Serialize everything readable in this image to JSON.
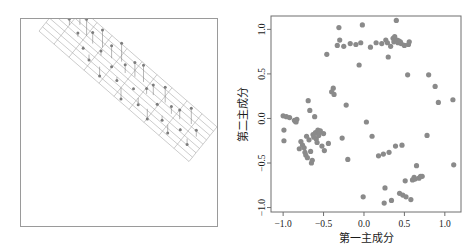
{
  "figure": {
    "panels": [
      {
        "name": "3d-regression-plane-plot",
        "type": "scatter3d-with-plane",
        "description": "3D scatter of observations with fitted regression plane and vertical residual drop-lines"
      },
      {
        "name": "pca-scatter-plot",
        "type": "scatter"
      }
    ]
  },
  "chart_data": [
    {
      "type": "scatter",
      "name": "3d-plane-panel",
      "title": "",
      "xlabel": "",
      "ylabel": "",
      "grid": false,
      "legend": false,
      "surface": {
        "kind": "regression-plane",
        "u_lines": 11,
        "v_lines": 9,
        "color": "#8c8c8c"
      },
      "note": "Points connected to the plane by vertical segments (residuals)",
      "points3d": [
        [
          0.06,
          0.62,
          0.3
        ],
        [
          0.1,
          0.55,
          0.13
        ],
        [
          0.14,
          0.71,
          0.42
        ],
        [
          0.17,
          0.48,
          0.08
        ],
        [
          0.2,
          0.63,
          0.35
        ],
        [
          0.22,
          0.4,
          -0.05
        ],
        [
          0.25,
          0.58,
          0.24
        ],
        [
          0.27,
          0.34,
          -0.12
        ],
        [
          0.3,
          0.66,
          0.38
        ],
        [
          0.32,
          0.5,
          0.1
        ],
        [
          0.35,
          0.29,
          -0.2
        ],
        [
          0.37,
          0.61,
          0.27
        ],
        [
          0.4,
          0.45,
          0.02
        ],
        [
          0.42,
          0.7,
          0.4
        ],
        [
          0.45,
          0.37,
          -0.08
        ],
        [
          0.47,
          0.56,
          0.18
        ],
        [
          0.5,
          0.25,
          -0.25
        ],
        [
          0.52,
          0.64,
          0.31
        ],
        [
          0.55,
          0.43,
          -0.02
        ],
        [
          0.57,
          0.68,
          0.36
        ],
        [
          0.6,
          0.33,
          -0.15
        ],
        [
          0.62,
          0.52,
          0.12
        ],
        [
          0.65,
          0.6,
          0.22
        ],
        [
          0.67,
          0.28,
          -0.22
        ],
        [
          0.7,
          0.47,
          0.04
        ],
        [
          0.72,
          0.65,
          0.33
        ],
        [
          0.75,
          0.38,
          -0.1
        ],
        [
          0.78,
          0.55,
          0.16
        ],
        [
          0.8,
          0.31,
          -0.18
        ],
        [
          0.83,
          0.58,
          0.2
        ],
        [
          0.86,
          0.44,
          -0.04
        ],
        [
          0.89,
          0.67,
          0.34
        ],
        [
          0.92,
          0.36,
          -0.13
        ],
        [
          0.95,
          0.53,
          0.14
        ]
      ]
    },
    {
      "type": "scatter",
      "name": "pca-scatter",
      "title": "",
      "xlabel": "第一主成分",
      "ylabel": "第二主成分",
      "xlim": [
        -1.15,
        1.2
      ],
      "ylim": [
        -1.05,
        1.15
      ],
      "xticks": [
        -1.0,
        -0.5,
        0.0,
        0.5,
        1.0
      ],
      "xticklabels": [
        "-1.0",
        "-0.5",
        "0.0",
        "0.5",
        "1.0"
      ],
      "yticks": [
        -1.0,
        -0.5,
        0.0,
        0.5,
        1.0
      ],
      "yticklabels": [
        "-1.0",
        "-0.5",
        "0.0",
        "0.5",
        "1.0"
      ],
      "grid": false,
      "legend": false,
      "marker": {
        "shape": "circle",
        "color": "#8a8a8a",
        "size": 2.6
      },
      "points": [
        [
          -1.0,
          0.03
        ],
        [
          -0.99,
          -0.13
        ],
        [
          -0.99,
          -0.25
        ],
        [
          -0.96,
          0.02
        ],
        [
          -0.92,
          0.01
        ],
        [
          -0.86,
          -0.02
        ],
        [
          -0.85,
          -0.03
        ],
        [
          -0.84,
          -0.04
        ],
        [
          -0.83,
          -0.01
        ],
        [
          -0.8,
          -0.34
        ],
        [
          -0.78,
          -0.26
        ],
        [
          -0.76,
          -0.3
        ],
        [
          -0.74,
          -0.33
        ],
        [
          -0.73,
          -0.38
        ],
        [
          -0.72,
          -0.41
        ],
        [
          -0.71,
          -0.2
        ],
        [
          -0.7,
          -0.44
        ],
        [
          -0.69,
          0.2
        ],
        [
          -0.68,
          -0.24
        ],
        [
          -0.67,
          0.09
        ],
        [
          -0.66,
          -0.37
        ],
        [
          -0.65,
          -0.5
        ],
        [
          -0.64,
          -0.47
        ],
        [
          -0.63,
          -0.18
        ],
        [
          -0.62,
          -0.21
        ],
        [
          -0.61,
          0.02
        ],
        [
          -0.6,
          -0.16
        ],
        [
          -0.59,
          -0.23
        ],
        [
          -0.58,
          -0.27
        ],
        [
          -0.57,
          -0.13
        ],
        [
          -0.56,
          -0.19
        ],
        [
          -0.55,
          -0.15
        ],
        [
          -0.54,
          -0.14
        ],
        [
          -0.52,
          -0.31
        ],
        [
          -0.5,
          -0.17
        ],
        [
          -0.49,
          -0.36
        ],
        [
          -0.46,
          0.72
        ],
        [
          -0.44,
          -0.28
        ],
        [
          -0.4,
          0.3
        ],
        [
          -0.38,
          0.34
        ],
        [
          -0.37,
          0.27
        ],
        [
          -0.33,
          0.82
        ],
        [
          -0.31,
          1.02
        ],
        [
          -0.3,
          0.88
        ],
        [
          -0.27,
          -0.22
        ],
        [
          -0.25,
          0.81
        ],
        [
          -0.22,
          0.15
        ],
        [
          -0.2,
          -0.46
        ],
        [
          -0.17,
          0.84
        ],
        [
          -0.1,
          0.83
        ],
        [
          -0.06,
          0.6
        ],
        [
          -0.04,
          0.85
        ],
        [
          -0.02,
          1.05
        ],
        [
          -0.01,
          -0.88
        ],
        [
          0.03,
          -0.04
        ],
        [
          0.08,
          0.8
        ],
        [
          0.1,
          -0.2
        ],
        [
          0.15,
          0.85
        ],
        [
          0.18,
          -0.42
        ],
        [
          0.22,
          0.84
        ],
        [
          0.24,
          -0.4
        ],
        [
          0.25,
          -0.95
        ],
        [
          0.26,
          -0.78
        ],
        [
          0.27,
          0.88
        ],
        [
          0.29,
          0.85
        ],
        [
          0.3,
          0.69
        ],
        [
          0.31,
          -0.38
        ],
        [
          0.33,
          0.81
        ],
        [
          0.34,
          -0.92
        ],
        [
          0.36,
          0.9
        ],
        [
          0.37,
          0.86
        ],
        [
          0.38,
          0.92
        ],
        [
          0.39,
          -0.31
        ],
        [
          0.4,
          1.1
        ],
        [
          0.41,
          0.88
        ],
        [
          0.42,
          0.85
        ],
        [
          0.43,
          0.87
        ],
        [
          0.44,
          -0.84
        ],
        [
          0.45,
          0.86
        ],
        [
          0.46,
          0.84
        ],
        [
          0.47,
          -0.3
        ],
        [
          0.48,
          -0.86
        ],
        [
          0.5,
          0.82
        ],
        [
          0.51,
          -0.7
        ],
        [
          0.52,
          -0.88
        ],
        [
          0.54,
          0.49
        ],
        [
          0.55,
          0.83
        ],
        [
          0.56,
          0.86
        ],
        [
          0.58,
          -0.91
        ],
        [
          0.6,
          -0.69
        ],
        [
          0.62,
          -0.66
        ],
        [
          0.63,
          -0.68
        ],
        [
          0.65,
          -0.53
        ],
        [
          0.68,
          -0.67
        ],
        [
          0.7,
          -0.65
        ],
        [
          0.72,
          -0.65
        ],
        [
          0.78,
          -0.19
        ],
        [
          0.8,
          0.49
        ],
        [
          0.88,
          0.36
        ],
        [
          0.92,
          0.18
        ],
        [
          1.1,
          0.21
        ],
        [
          1.11,
          -0.52
        ]
      ]
    }
  ]
}
